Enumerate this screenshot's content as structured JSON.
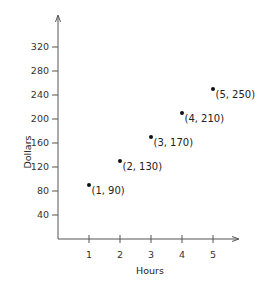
{
  "chart_data": {
    "type": "scatter",
    "title": "",
    "xlabel": "Hours",
    "ylabel": "Dollars",
    "x_ticks": [
      1,
      2,
      3,
      4,
      5
    ],
    "y_ticks": [
      40,
      80,
      120,
      160,
      200,
      240,
      280,
      320
    ],
    "xlim": [
      0,
      5.8
    ],
    "ylim": [
      0,
      375
    ],
    "grid": false,
    "legend": null,
    "points": [
      {
        "x": 1,
        "y": 90,
        "label": "(1, 90)"
      },
      {
        "x": 2,
        "y": 130,
        "label": "(2, 130)"
      },
      {
        "x": 3,
        "y": 170,
        "label": "(3, 170)"
      },
      {
        "x": 4,
        "y": 210,
        "label": "(4, 210)"
      },
      {
        "x": 5,
        "y": 250,
        "label": "(5, 250)"
      }
    ],
    "colors": {
      "axis": "#555555",
      "point": "#111111",
      "text": "#222222"
    }
  }
}
